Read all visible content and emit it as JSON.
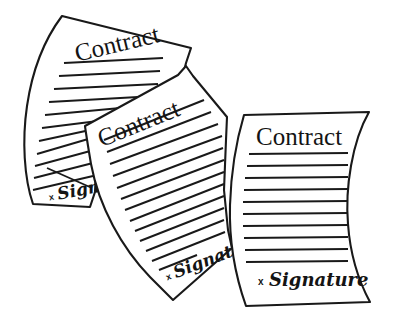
{
  "image": {
    "kind": "line-art-clipart",
    "subject": "three overlapping contract documents",
    "background_color": "#ffffff",
    "ink_color": "#191919",
    "width": 396,
    "height": 330
  },
  "documents": [
    {
      "id": "left",
      "title": "Contract",
      "signature_label": "Signature",
      "signature_mark": "x",
      "rule_line_count": 12,
      "rotation_deg": -16,
      "partially_occluded": true,
      "occluded_by": "middle"
    },
    {
      "id": "middle",
      "title": "Contract",
      "signature_label": "Signature",
      "signature_mark": "x",
      "rule_line_count": 13,
      "rotation_deg": -23,
      "partially_occluded": true,
      "occluded_by": "right"
    },
    {
      "id": "right",
      "title": "Contract",
      "signature_label": "Signature",
      "signature_mark": "x",
      "rule_line_count": 10,
      "rotation_deg": 0,
      "partially_occluded": false,
      "occluded_by": ""
    }
  ]
}
